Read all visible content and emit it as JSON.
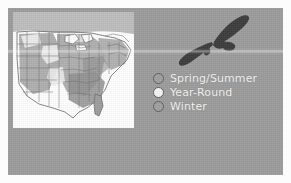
{
  "panel": {
    "background_color": "#9c9c9c",
    "page_background_color": "#fcfcfc"
  },
  "map": {
    "name": "range-map-eastern-united-states",
    "background_color": "#fefefe",
    "outline_color": "#6f6f6f",
    "regions": {
      "spring_summer_color": "#a8a8a8",
      "year_round_color": "#f0f0f0",
      "winter_color": "#8f8f8f"
    }
  },
  "bird": {
    "name": "soaring-hawk-silhouette",
    "color": "#3c3c3c"
  },
  "legend": {
    "items": [
      {
        "label": "Spring/Summer",
        "swatch_color": "#a0a0a0",
        "swatch_border": "#5d5d5d"
      },
      {
        "label": "Year-Round",
        "swatch_color": "#f4f4f4",
        "swatch_border": "#5d5d5d"
      },
      {
        "label": "Winter",
        "swatch_color": "#a0a0a0",
        "swatch_border": "#5d5d5d"
      }
    ],
    "text_color": "#f2f2f2"
  }
}
